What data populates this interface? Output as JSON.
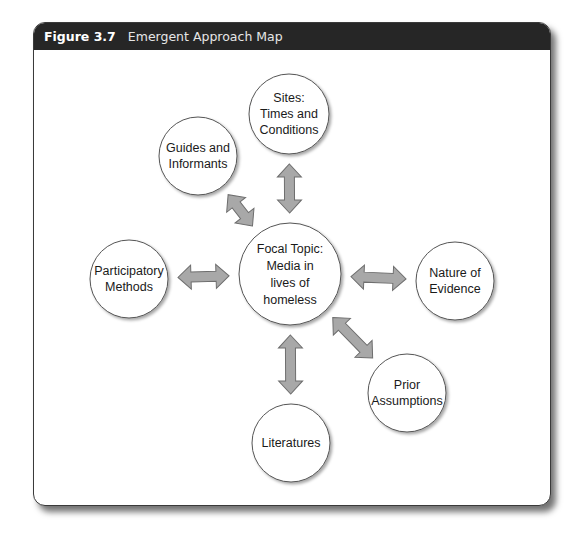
{
  "figure": {
    "number": "Figure 3.7",
    "title": "Emergent Approach Map"
  },
  "colors": {
    "header_bg": "#262626",
    "arrow_fill": "#a8a8a8",
    "arrow_stroke": "#6e6e6e",
    "node_stroke": "#555555"
  },
  "nodes": [
    {
      "id": "focal",
      "lines": [
        "Focal Topic:",
        "Media in",
        "lives of",
        "homeless"
      ]
    },
    {
      "id": "sites",
      "lines": [
        "Sites:",
        "Times and",
        "Conditions"
      ]
    },
    {
      "id": "guides",
      "lines": [
        "Guides and",
        "Informants"
      ]
    },
    {
      "id": "participatory",
      "lines": [
        "Participatory",
        "Methods"
      ]
    },
    {
      "id": "nature",
      "lines": [
        "Nature of",
        "Evidence"
      ]
    },
    {
      "id": "prior",
      "lines": [
        "Prior",
        "Assumptions"
      ]
    },
    {
      "id": "literatures",
      "lines": [
        "Literatures"
      ]
    }
  ],
  "edges": [
    {
      "from": "focal",
      "to": "sites",
      "type": "bidirectional"
    },
    {
      "from": "focal",
      "to": "guides",
      "type": "bidirectional"
    },
    {
      "from": "focal",
      "to": "participatory",
      "type": "bidirectional"
    },
    {
      "from": "focal",
      "to": "nature",
      "type": "bidirectional"
    },
    {
      "from": "focal",
      "to": "prior",
      "type": "bidirectional"
    },
    {
      "from": "focal",
      "to": "literatures",
      "type": "bidirectional"
    }
  ]
}
